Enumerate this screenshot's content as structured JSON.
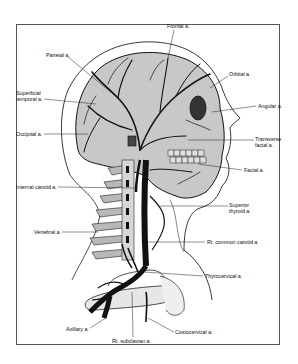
{
  "diagram": {
    "labels": [
      {
        "id": "frontal",
        "text": "Frontal a.",
        "x": 167,
        "y": 25
      },
      {
        "id": "parietal",
        "text": "Parietal a.",
        "x": 46,
        "y": 52
      },
      {
        "id": "orbital",
        "text": "Orbital a.",
        "x": 229,
        "y": 72
      },
      {
        "id": "superficial-temporal",
        "text_lines": [
          "Superficial",
          "temporal a."
        ],
        "x": 16,
        "y": 91
      },
      {
        "id": "angular",
        "text": "Angular a.",
        "x": 258,
        "y": 103
      },
      {
        "id": "occipital",
        "text": "Occipital a.",
        "x": 16,
        "y": 131
      },
      {
        "id": "transverse-facial",
        "text_lines": [
          "Transverse",
          "facial a."
        ],
        "x": 255,
        "y": 137
      },
      {
        "id": "facial",
        "text": "Facial a.",
        "x": 244,
        "y": 167
      },
      {
        "id": "internal-carotid",
        "text": "Internal carotid a.",
        "x": 16,
        "y": 184
      },
      {
        "id": "superior-thyroid",
        "text_lines": [
          "Superior",
          "thyroid a."
        ],
        "x": 229,
        "y": 203
      },
      {
        "id": "vertebral",
        "text": "Vertebral a.",
        "x": 34,
        "y": 229
      },
      {
        "id": "rt-common-carotid",
        "text": "Rt. common carotid a.",
        "x": 207,
        "y": 239
      },
      {
        "id": "thyrocervical",
        "text": "Thyrocervical a.",
        "x": 205,
        "y": 273
      },
      {
        "id": "axillary",
        "text": "Axillary a.",
        "x": 66,
        "y": 327
      },
      {
        "id": "costocervical",
        "text": "Costocervical a.",
        "x": 175,
        "y": 329
      },
      {
        "id": "rt-subclavian",
        "text": "Rt. subclavian a.",
        "x": 112,
        "y": 339
      }
    ]
  }
}
